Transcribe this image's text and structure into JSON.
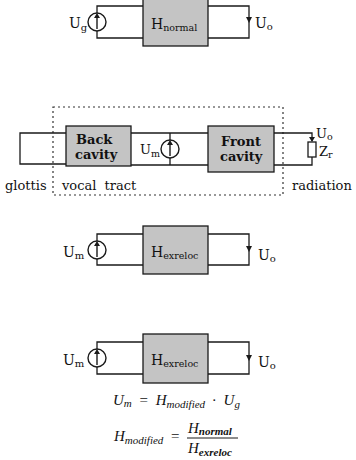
{
  "diagram_normal": {
    "source_label": "U",
    "source_sub": "g",
    "box_label": "H",
    "box_sub": "normal",
    "output_label": "U",
    "output_sub": "o"
  },
  "diagram_vocal_tract": {
    "back_cavity_line1": "Back",
    "back_cavity_line2": "cavity",
    "front_cavity_line1": "Front",
    "front_cavity_line2": "cavity",
    "source_label": "U",
    "source_sub": "m",
    "output_label": "U",
    "output_sub": "o",
    "impedance_label": "Z",
    "impedance_sub": "r",
    "region_glottis": "glottis",
    "region_vocal_tract": "vocal  tract",
    "region_radiation": "radiation"
  },
  "diagram_exreloc_1": {
    "source_label": "U",
    "source_sub": "m",
    "box_label": "H",
    "box_sub": "exreloc",
    "output_label": "U",
    "output_sub": "o"
  },
  "diagram_exreloc_2": {
    "source_label": "U",
    "source_sub": "m",
    "box_label": "H",
    "box_sub": "exreloc",
    "output_label": "U",
    "output_sub": "o"
  },
  "equations": {
    "eq1_lhs": "U",
    "eq1_lhs_sub": "m",
    "eq1_equals": "=",
    "eq1_h": "H",
    "eq1_h_sub": "modified",
    "eq1_dot": "·",
    "eq1_u": "U",
    "eq1_u_sub": "g",
    "eq2_lhs": "H",
    "eq2_lhs_sub": "modified",
    "eq2_equals": "=",
    "eq2_num": "H",
    "eq2_num_sub": "normal",
    "eq2_den": "H",
    "eq2_den_sub": "exreloc"
  },
  "colors": {
    "box_fill": "#c4c4c4",
    "stroke": "#1a1a1a"
  }
}
